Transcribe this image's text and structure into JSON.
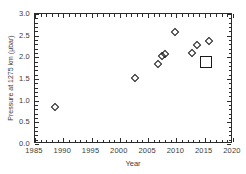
{
  "chart_data": {
    "type": "scatter",
    "title": "",
    "xlabel": "Year",
    "ylabel": "Pressure at 1275 km (μbar)",
    "xlim": [
      1985,
      2020
    ],
    "ylim": [
      0.0,
      3.0
    ],
    "xticks": [
      1985,
      1990,
      1995,
      2000,
      2005,
      2010,
      2015,
      2020
    ],
    "xticklabels": [
      "1985",
      "1990",
      "1995",
      "2000",
      "2005",
      "2010",
      "2015",
      "2020"
    ],
    "yticks": [
      0.0,
      0.5,
      1.0,
      1.5,
      2.0,
      2.5,
      3.0
    ],
    "yticklabels": [
      "0.0",
      "0.5",
      "1.0",
      "1.5",
      "2.0",
      "2.5",
      "3.0"
    ],
    "grid": false,
    "legend": null,
    "marker_color": "#1a1a1a",
    "axis_color": "#2b2b2b",
    "background": "#ffffff",
    "series": [
      {
        "name": "measurements",
        "marker": "diamond",
        "points": [
          {
            "x": 1988.5,
            "y": 0.85
          },
          {
            "x": 2002.7,
            "y": 1.53
          },
          {
            "x": 2006.7,
            "y": 1.85
          },
          {
            "x": 2007.5,
            "y": 2.03
          },
          {
            "x": 2007.9,
            "y": 2.07
          },
          {
            "x": 2009.7,
            "y": 2.58
          },
          {
            "x": 2012.8,
            "y": 2.09
          },
          {
            "x": 2013.6,
            "y": 2.28
          },
          {
            "x": 2015.8,
            "y": 2.38
          }
        ]
      },
      {
        "name": "model",
        "marker": "square",
        "points": [
          {
            "x": 2015.3,
            "y": 1.9
          }
        ]
      }
    ]
  }
}
